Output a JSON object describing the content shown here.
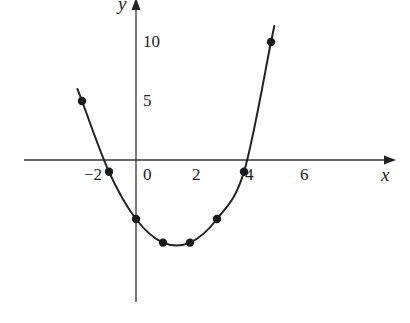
{
  "chart_data": {
    "type": "line",
    "title": "",
    "xlabel": "x",
    "ylabel": "y",
    "x_ticks": [
      "−2",
      "0",
      "2",
      "4",
      "6"
    ],
    "y_ticks": [
      "5",
      "10"
    ],
    "xlim": [
      -4,
      9
    ],
    "ylim": [
      -10,
      12
    ],
    "grid": false,
    "legend": null,
    "series": [
      {
        "name": "curve",
        "style": "smooth curve with dot markers",
        "points": [
          {
            "x": -2,
            "y": 5
          },
          {
            "x": -1,
            "y": -1
          },
          {
            "x": 0,
            "y": -5
          },
          {
            "x": 1,
            "y": -7
          },
          {
            "x": 2,
            "y": -7
          },
          {
            "x": 3,
            "y": -5
          },
          {
            "x": 4,
            "y": -1
          },
          {
            "x": 5,
            "y": 10
          }
        ]
      }
    ]
  },
  "labels": {
    "x_axis": "x",
    "y_axis": "y",
    "tick_m2": "−2",
    "tick_0": "0",
    "tick_2": "2",
    "tick_4": "4",
    "tick_6": "6",
    "tick_y5": "5",
    "tick_y10": "10"
  }
}
